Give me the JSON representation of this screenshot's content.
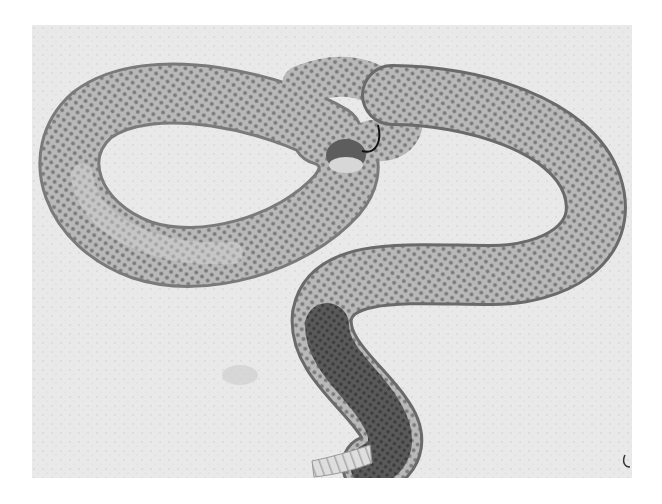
{
  "image": {
    "subject": "rattlesnake",
    "description": "Grayscale photograph of a coiled rattlesnake on sandy ground, head raised near the center of a loop, tail with rattle at bottom",
    "style": "black-and-white photograph",
    "colors": {
      "page_background": "#ffffff",
      "sand": "#e9e9e9",
      "sand_speckle": "#b8b8b8",
      "body_light": "#c4c4c4",
      "body_mid": "#8a8a8a",
      "body_dark": "#4a4a4a",
      "tail_dark": "#2e2e2e",
      "rattle": "#dcdcdc",
      "shadow": "#1a1a1a"
    },
    "regions": {
      "photo_frame": {
        "x": 32,
        "y": 25,
        "width": 600,
        "height": 453
      },
      "head": {
        "x": 345,
        "y": 135
      },
      "coil_loop_center": {
        "x": 225,
        "y": 145
      },
      "rattle": {
        "x": 330,
        "y": 455
      }
    }
  }
}
